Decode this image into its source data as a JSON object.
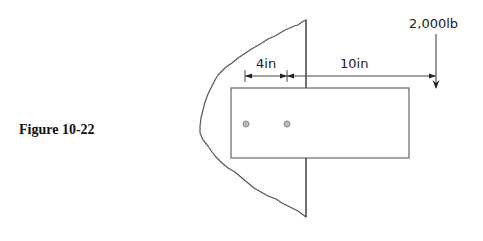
{
  "figure": {
    "caption": "Figure 10-22"
  },
  "diagram": {
    "dimension_bolt_spacing": "4in",
    "dimension_load_distance": "10in",
    "load_label": "2,000lb",
    "bolt_count": 2,
    "colors": {
      "line": "#555555",
      "bolt_fill": "#bbbbbb",
      "arrow": "#222222"
    }
  }
}
